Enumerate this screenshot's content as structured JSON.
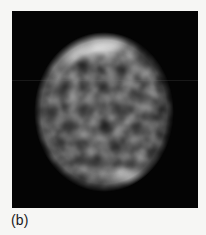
{
  "figure": {
    "caption": "(b)",
    "panel_label": "b",
    "background_color": "#f6f6f4",
    "panel": {
      "background_color": "#040404",
      "x": 12,
      "y": 11,
      "width": 186,
      "height": 197,
      "modality": "grayscale speckle / tomographic reconstruction"
    }
  },
  "chart_data": {
    "type": "heatmap",
    "title": "(b)",
    "subtitle": "",
    "xlabel": "",
    "ylabel": "",
    "colormap": "grayscale",
    "value_range": [
      0,
      255
    ],
    "background_value": 0,
    "legend": "none",
    "grid": false,
    "annotations": [
      {
        "name": "upper-left-bright-arc",
        "description": "bright crescent along the upper-left limb of the disk",
        "peak_intensity": 248,
        "center_x": 98,
        "center_y": 44
      },
      {
        "name": "lower-right-bright-arc",
        "description": "bright crescent along the lower-right limb of the disk",
        "peak_intensity": 238,
        "center_x": 133,
        "center_y": 180
      },
      {
        "name": "speckled-interior",
        "description": "mottled mid-grey granular texture filling the disk interior",
        "mean_intensity": 70
      }
    ],
    "object": {
      "shape": "disk",
      "center_x": 104,
      "center_y": 112,
      "radius_x": 68,
      "radius_y": 78,
      "edge_softness_px": 7
    },
    "speckles": [
      {
        "x": 62,
        "y": 52,
        "r": 13,
        "i": 118
      },
      {
        "x": 78,
        "y": 44,
        "r": 15,
        "i": 196
      },
      {
        "x": 96,
        "y": 40,
        "r": 17,
        "i": 244
      },
      {
        "x": 114,
        "y": 42,
        "r": 15,
        "i": 214
      },
      {
        "x": 130,
        "y": 50,
        "r": 13,
        "i": 150
      },
      {
        "x": 52,
        "y": 64,
        "r": 12,
        "i": 96
      },
      {
        "x": 70,
        "y": 60,
        "r": 11,
        "i": 128
      },
      {
        "x": 90,
        "y": 58,
        "r": 12,
        "i": 132
      },
      {
        "x": 110,
        "y": 58,
        "r": 13,
        "i": 120
      },
      {
        "x": 132,
        "y": 66,
        "r": 13,
        "i": 104
      },
      {
        "x": 148,
        "y": 76,
        "r": 12,
        "i": 92
      },
      {
        "x": 44,
        "y": 84,
        "r": 12,
        "i": 88
      },
      {
        "x": 58,
        "y": 80,
        "r": 11,
        "i": 112
      },
      {
        "x": 74,
        "y": 78,
        "r": 12,
        "i": 96
      },
      {
        "x": 92,
        "y": 76,
        "r": 11,
        "i": 104
      },
      {
        "x": 112,
        "y": 78,
        "r": 12,
        "i": 116
      },
      {
        "x": 130,
        "y": 84,
        "r": 12,
        "i": 98
      },
      {
        "x": 150,
        "y": 92,
        "r": 11,
        "i": 86
      },
      {
        "x": 40,
        "y": 102,
        "r": 12,
        "i": 94
      },
      {
        "x": 56,
        "y": 98,
        "r": 11,
        "i": 108
      },
      {
        "x": 72,
        "y": 96,
        "r": 12,
        "i": 124
      },
      {
        "x": 90,
        "y": 98,
        "r": 13,
        "i": 118
      },
      {
        "x": 108,
        "y": 96,
        "r": 12,
        "i": 108
      },
      {
        "x": 126,
        "y": 100,
        "r": 12,
        "i": 102
      },
      {
        "x": 146,
        "y": 106,
        "r": 12,
        "i": 90
      },
      {
        "x": 42,
        "y": 120,
        "r": 12,
        "i": 88
      },
      {
        "x": 58,
        "y": 118,
        "r": 11,
        "i": 100
      },
      {
        "x": 76,
        "y": 116,
        "r": 12,
        "i": 112
      },
      {
        "x": 94,
        "y": 118,
        "r": 12,
        "i": 106
      },
      {
        "x": 112,
        "y": 116,
        "r": 11,
        "i": 114
      },
      {
        "x": 130,
        "y": 120,
        "r": 12,
        "i": 96
      },
      {
        "x": 148,
        "y": 124,
        "r": 11,
        "i": 84
      },
      {
        "x": 46,
        "y": 138,
        "r": 12,
        "i": 92
      },
      {
        "x": 64,
        "y": 136,
        "r": 11,
        "i": 104
      },
      {
        "x": 82,
        "y": 134,
        "r": 12,
        "i": 118
      },
      {
        "x": 100,
        "y": 136,
        "r": 12,
        "i": 108
      },
      {
        "x": 118,
        "y": 134,
        "r": 11,
        "i": 100
      },
      {
        "x": 136,
        "y": 138,
        "r": 12,
        "i": 94
      },
      {
        "x": 152,
        "y": 142,
        "r": 10,
        "i": 80
      },
      {
        "x": 54,
        "y": 154,
        "r": 12,
        "i": 86
      },
      {
        "x": 72,
        "y": 152,
        "r": 11,
        "i": 98
      },
      {
        "x": 90,
        "y": 152,
        "r": 12,
        "i": 104
      },
      {
        "x": 108,
        "y": 154,
        "r": 12,
        "i": 96
      },
      {
        "x": 126,
        "y": 156,
        "r": 11,
        "i": 102
      },
      {
        "x": 142,
        "y": 158,
        "r": 11,
        "i": 88
      },
      {
        "x": 66,
        "y": 168,
        "r": 11,
        "i": 84
      },
      {
        "x": 84,
        "y": 170,
        "r": 11,
        "i": 92
      },
      {
        "x": 102,
        "y": 172,
        "r": 12,
        "i": 100
      },
      {
        "x": 120,
        "y": 176,
        "r": 14,
        "i": 178
      },
      {
        "x": 136,
        "y": 180,
        "r": 15,
        "i": 232
      },
      {
        "x": 150,
        "y": 176,
        "r": 12,
        "i": 170
      },
      {
        "x": 92,
        "y": 182,
        "r": 11,
        "i": 96
      }
    ],
    "dark_voids": [
      {
        "x": 84,
        "y": 66,
        "r": 9
      },
      {
        "x": 120,
        "y": 70,
        "r": 8
      },
      {
        "x": 64,
        "y": 90,
        "r": 9
      },
      {
        "x": 104,
        "y": 88,
        "r": 8
      },
      {
        "x": 140,
        "y": 96,
        "r": 8
      },
      {
        "x": 52,
        "y": 112,
        "r": 8
      },
      {
        "x": 84,
        "y": 110,
        "r": 9
      },
      {
        "x": 118,
        "y": 108,
        "r": 8
      },
      {
        "x": 68,
        "y": 128,
        "r": 8
      },
      {
        "x": 104,
        "y": 128,
        "r": 9
      },
      {
        "x": 138,
        "y": 130,
        "r": 8
      },
      {
        "x": 80,
        "y": 146,
        "r": 8
      },
      {
        "x": 116,
        "y": 146,
        "r": 8
      },
      {
        "x": 60,
        "y": 144,
        "r": 7
      },
      {
        "x": 96,
        "y": 162,
        "r": 8
      },
      {
        "x": 130,
        "y": 164,
        "r": 7
      }
    ]
  }
}
